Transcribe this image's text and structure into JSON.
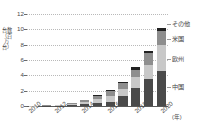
{
  "chart_data": {
    "type": "bar",
    "stacked": true,
    "title": "",
    "xlabel": "(年)",
    "ylabel": "台数（百万台）",
    "ylim": [
      0,
      12
    ],
    "yticks": [
      0,
      2,
      4,
      6,
      8,
      10,
      12
    ],
    "grid": true,
    "legend_position": "right",
    "x": [
      2010,
      2011,
      2012,
      2013,
      2014,
      2015,
      2016,
      2017,
      2018,
      2019,
      2020
    ],
    "xtick_labels": [
      "2010",
      "2012",
      "2014",
      "2016",
      "2018",
      "2020"
    ],
    "xtick_years": [
      2010,
      2012,
      2014,
      2016,
      2018,
      2020
    ],
    "series": [
      {
        "name": "中国",
        "color": "#4a4a4a",
        "values": [
          0.01,
          0.02,
          0.05,
          0.1,
          0.2,
          0.35,
          0.55,
          1.3,
          2.4,
          3.5,
          4.6
        ]
      },
      {
        "name": "欧州",
        "color": "#c8c8c8",
        "values": [
          0.02,
          0.03,
          0.05,
          0.15,
          0.35,
          0.55,
          0.75,
          0.95,
          1.35,
          1.9,
          3.4
        ]
      },
      {
        "name": "米国",
        "color": "#8e8e8e",
        "values": [
          0.02,
          0.03,
          0.05,
          0.12,
          0.25,
          0.4,
          0.6,
          0.7,
          1.0,
          1.5,
          1.8
        ]
      },
      {
        "name": "その他",
        "color": "#222222",
        "values": [
          0.0,
          0.01,
          0.02,
          0.03,
          0.05,
          0.1,
          0.15,
          0.2,
          0.35,
          0.3,
          0.4
        ]
      }
    ],
    "totals": [
      0.05,
      0.09,
      0.17,
      0.4,
      0.85,
      1.4,
      2.05,
      3.15,
      5.1,
      7.2,
      10.2
    ]
  },
  "legend": {
    "items": [
      {
        "label": "その他",
        "color": "#222222"
      },
      {
        "label": "米国",
        "color": "#8e8e8e"
      },
      {
        "label": "欧州",
        "color": "#c8c8c8"
      },
      {
        "label": "中国",
        "color": "#4a4a4a"
      }
    ]
  },
  "axes": {
    "y_title": "台数（百万台）",
    "y_tick_0": "0",
    "y_tick_2": "2",
    "y_tick_4": "4",
    "y_tick_6": "6",
    "y_tick_8": "8",
    "y_tick_10": "10",
    "y_tick_12": "12",
    "x_tick_2010": "2010",
    "x_tick_2012": "2012",
    "x_tick_2014": "2014",
    "x_tick_2016": "2016",
    "x_tick_2018": "2018",
    "x_tick_2020": "2020",
    "x_unit": "(年)"
  }
}
